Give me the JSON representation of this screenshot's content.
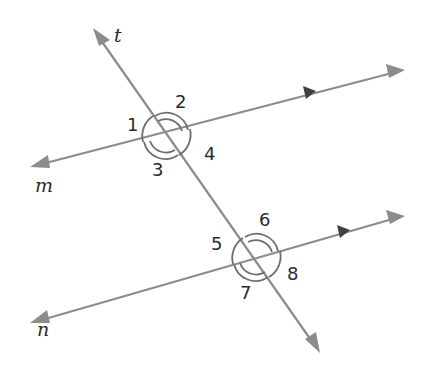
{
  "diagram": {
    "lines": {
      "transversal": {
        "label": "t"
      },
      "top_parallel": {
        "label": "m"
      },
      "bottom_parallel": {
        "label": "n"
      }
    },
    "angles": [
      {
        "label": "1",
        "position": "top intersection, left",
        "arcs": 1
      },
      {
        "label": "2",
        "position": "top intersection, top",
        "arcs": 2
      },
      {
        "label": "3",
        "position": "top intersection, bottom",
        "arcs": 2
      },
      {
        "label": "4",
        "position": "top intersection, right",
        "arcs": 1
      },
      {
        "label": "5",
        "position": "bottom intersection, left",
        "arcs": 1
      },
      {
        "label": "6",
        "position": "bottom intersection, top",
        "arcs": 2
      },
      {
        "label": "7",
        "position": "bottom intersection, bottom",
        "arcs": 2
      },
      {
        "label": "8",
        "position": "bottom intersection, right",
        "arcs": 1
      }
    ],
    "parallel_marker": "single arrowhead on each of m and n",
    "colors": {
      "line": "#8c8c8c",
      "arc": "#6e6e6e",
      "text": "#2a2a2a",
      "marker": "#404040"
    }
  }
}
